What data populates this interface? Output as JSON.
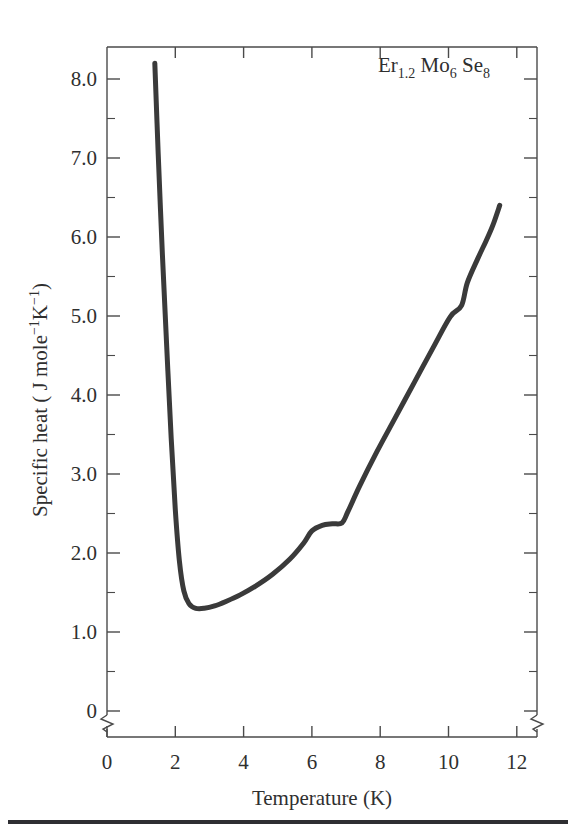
{
  "figure": {
    "annotation": {
      "element": "Er",
      "sub1": "1.2",
      "element2": "Mo",
      "sub2": "6",
      "element3": "Se",
      "sub3": "8",
      "full_text": "Er1.2 Mo6 Se8"
    },
    "line_color": "#3a3a3a",
    "axis_color": "#4a4a4a",
    "background": "#ffffff"
  },
  "axes": {
    "x": {
      "title": "Temperature (K)",
      "ticks": [
        "0",
        "2",
        "4",
        "6",
        "8",
        "10",
        "12"
      ],
      "tick_values": [
        0,
        2,
        4,
        6,
        8,
        10,
        12
      ],
      "range": [
        0,
        12.6
      ],
      "minor_step": 1
    },
    "y": {
      "title_parts": {
        "lead": "Specific heat ( J mole",
        "sup1": "−1",
        "mid": "K",
        "sup2": "−1",
        "tail": ")"
      },
      "title": "Specific heat ( J mole−1K−1)",
      "ticks": [
        "8.0",
        "7.0",
        "6.0",
        "5.0",
        "4.0",
        "3.0",
        "2.0",
        "1.0",
        "0"
      ],
      "tick_values": [
        8.0,
        7.0,
        6.0,
        5.0,
        4.0,
        3.0,
        2.0,
        1.0,
        0
      ],
      "range": [
        0.8,
        8.7
      ],
      "axis_break_between": [
        "1.0",
        "0"
      ],
      "minor_step": 0.5
    }
  },
  "chart_data": {
    "type": "line",
    "title": "",
    "subtitle": "",
    "xlabel": "Temperature (K)",
    "ylabel": "Specific heat ( J mole−1K−1)",
    "xlim": [
      0,
      12.6
    ],
    "ylim": [
      0.8,
      8.7
    ],
    "grid": false,
    "legend": null,
    "annotations": [
      {
        "text": "Er1.2 Mo6 Se8",
        "x": 9.6,
        "y": 8.45
      }
    ],
    "series": [
      {
        "name": "Er1.2Mo6Se8 specific heat",
        "color": "#3a3a3a",
        "linewidth": 5,
        "x": [
          1.4,
          1.5,
          1.62,
          1.75,
          1.88,
          2.0,
          2.12,
          2.25,
          2.4,
          2.6,
          2.85,
          3.15,
          3.5,
          3.9,
          4.35,
          4.85,
          5.35,
          5.75,
          6.0,
          6.3,
          6.6,
          6.88,
          7.05,
          7.4,
          7.9,
          8.45,
          9.0,
          9.55,
          10.05,
          10.38,
          10.55,
          10.85,
          11.1,
          11.3,
          11.5
        ],
        "y": [
          8.2,
          7.05,
          5.8,
          4.6,
          3.45,
          2.55,
          1.9,
          1.52,
          1.36,
          1.3,
          1.3,
          1.33,
          1.39,
          1.47,
          1.58,
          1.73,
          1.92,
          2.12,
          2.28,
          2.35,
          2.37,
          2.38,
          2.52,
          2.85,
          3.28,
          3.72,
          4.16,
          4.6,
          4.99,
          5.13,
          5.42,
          5.72,
          5.95,
          6.15,
          6.4
        ]
      }
    ]
  }
}
